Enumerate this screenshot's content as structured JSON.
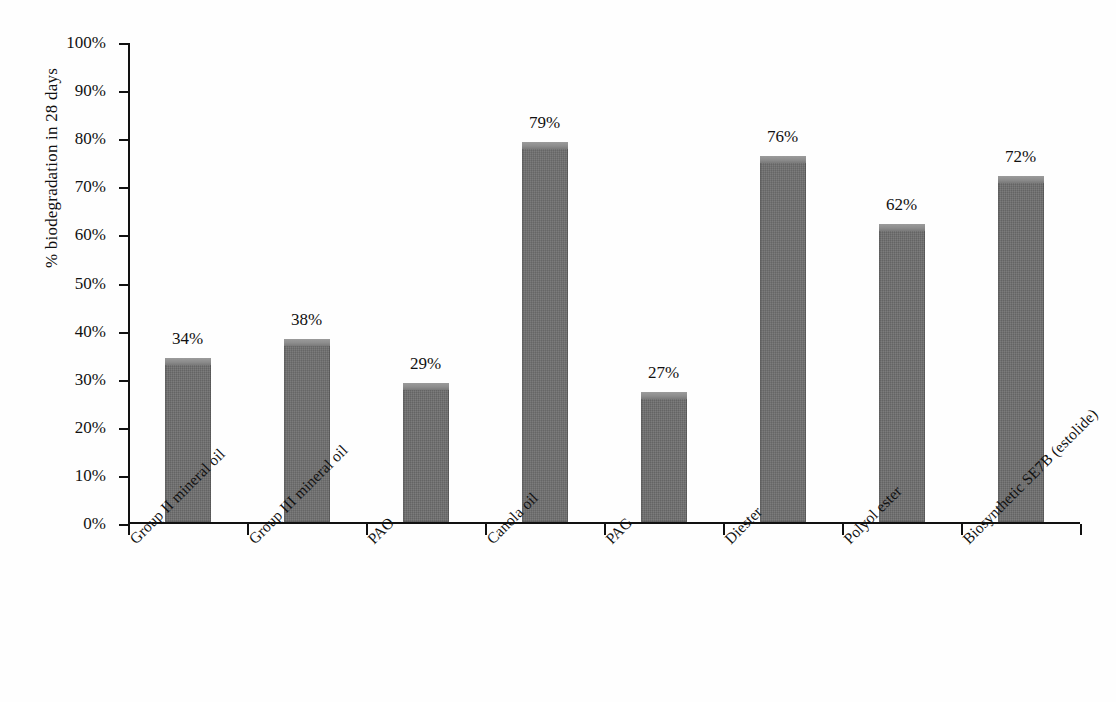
{
  "chart_data": {
    "type": "bar",
    "title": "",
    "xlabel": "",
    "ylabel": "% biodegradation in 28 days",
    "ylim": [
      0,
      100
    ],
    "grid": false,
    "legend": "none",
    "value_label_suffix": "%",
    "categories": [
      "Group II mineral oil",
      "Group III mineral oil",
      "PAO",
      "Canola oil",
      "PAG",
      "Diester",
      "Polyol ester",
      "Biosynthetic SE7B (estolide)"
    ],
    "values": [
      34,
      38,
      29,
      79,
      27,
      76,
      62,
      72
    ],
    "value_labels": [
      "34%",
      "38%",
      "29%",
      "79%",
      "27%",
      "76%",
      "62%",
      "72%"
    ],
    "ytick_labels": [
      "0%",
      "10%",
      "20%",
      "30%",
      "40%",
      "50%",
      "60%",
      "70%",
      "80%",
      "90%",
      "100%"
    ],
    "ytick_values": [
      0,
      10,
      20,
      30,
      40,
      50,
      60,
      70,
      80,
      90,
      100
    ],
    "colors": {
      "bar_fill": "#6f6f6f",
      "bar_top_highlight": "#9b9b9b",
      "axis": "#111111",
      "text": "#111111",
      "background": "#fefefe"
    }
  }
}
